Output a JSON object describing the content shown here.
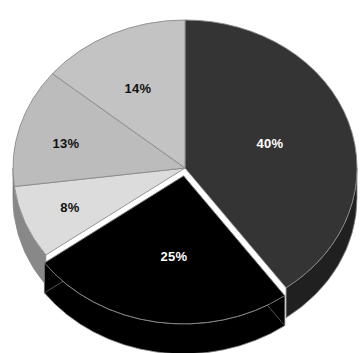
{
  "chart_data": {
    "type": "pie",
    "title": "",
    "subtitle": "",
    "xlabel": "",
    "ylabel": "",
    "grid": false,
    "legend": "none",
    "three_d": true,
    "exploded_slices": [
      "25%"
    ],
    "start_angle_deg": 0,
    "direction": "clockwise",
    "categories": [
      "40%",
      "25%",
      "8%",
      "13%",
      "14%"
    ],
    "values": [
      40,
      25,
      8,
      13,
      14
    ],
    "labels": [
      "40%",
      "25%",
      "8%",
      "13%",
      "14%"
    ],
    "colors": [
      "#343434",
      "#000000",
      "#dcdcdc",
      "#bcbcbc",
      "#c3c3c3"
    ],
    "label_colors": [
      "#ffffff",
      "#ffffff",
      "#111111",
      "#111111",
      "#111111"
    ],
    "slices": [
      {
        "label": "40%",
        "value": 40,
        "color": "#343434",
        "label_color": "#ffffff",
        "label_x": 270,
        "label_y": 143
      },
      {
        "label": "25%",
        "value": 25,
        "color": "#000000",
        "label_color": "#ffffff",
        "label_x": 174,
        "label_y": 256
      },
      {
        "label": "8%",
        "value": 8,
        "color": "#dcdcdc",
        "label_color": "#111111",
        "label_x": 70,
        "label_y": 207
      },
      {
        "label": "13%",
        "value": 13,
        "color": "#bcbcbc",
        "label_color": "#111111",
        "label_x": 66,
        "label_y": 143
      },
      {
        "label": "14%",
        "value": 14,
        "color": "#c3c3c3",
        "label_color": "#111111",
        "label_x": 138,
        "label_y": 88
      }
    ]
  },
  "geometry": {
    "center_x": 185,
    "center_y": 168,
    "radius_x": 172,
    "radius_y": 148,
    "depth": 30
  },
  "style": {
    "background": "#ffffff",
    "edge_color": "#8a8a8a"
  }
}
